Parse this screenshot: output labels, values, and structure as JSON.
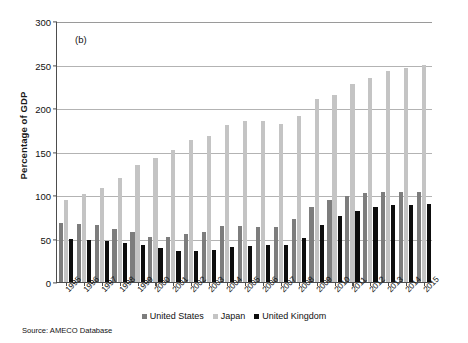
{
  "panel_label": "(b)",
  "source_note": "Source: AMECO Database",
  "axis": {
    "y_title": "Percentage of GDP"
  },
  "legend": {
    "items": [
      {
        "label": "United States",
        "color": "#7d7d7d"
      },
      {
        "label": "Japan",
        "color": "#c4c4c4"
      },
      {
        "label": "United Kingdom",
        "color": "#0d0d0d"
      }
    ]
  },
  "chart_data": {
    "type": "bar",
    "title": "(b)",
    "subtitle": "",
    "xlabel": "",
    "ylabel": "Percentage of GDP",
    "ylim": [
      0,
      300
    ],
    "yticks": [
      0,
      50,
      100,
      150,
      200,
      250,
      300
    ],
    "grid": true,
    "legend_position": "bottom",
    "categories": [
      "1995",
      "1996",
      "1997",
      "1998",
      "1999",
      "2000",
      "2001",
      "2002",
      "2003",
      "2004",
      "2005",
      "2006",
      "2007",
      "2008",
      "2009",
      "2010",
      "2011",
      "2012",
      "2013",
      "2014",
      "2015"
    ],
    "series": [
      {
        "name": "United States",
        "color": "#7d7d7d",
        "values": [
          68,
          67,
          65,
          61,
          58,
          52,
          52,
          55,
          58,
          64,
          64,
          63,
          63,
          72,
          86,
          94,
          99,
          102,
          104,
          104,
          104
        ]
      },
      {
        "name": "Japan",
        "color": "#c4c4c4",
        "values": [
          94,
          101,
          108,
          120,
          135,
          143,
          152,
          163,
          168,
          180,
          185,
          185,
          182,
          191,
          210,
          215,
          228,
          235,
          242,
          246,
          250
        ]
      },
      {
        "name": "United Kingdom",
        "color": "#0d0d0d",
        "values": [
          49,
          48,
          47,
          45,
          42,
          39,
          36,
          36,
          37,
          40,
          41,
          42,
          43,
          51,
          66,
          76,
          82,
          86,
          88,
          89,
          90
        ]
      }
    ]
  }
}
